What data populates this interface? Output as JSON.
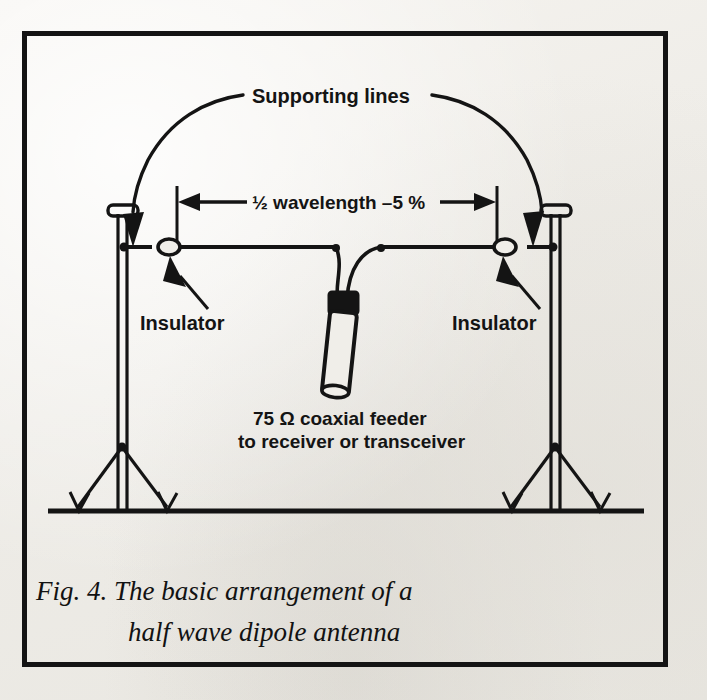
{
  "figure": {
    "domain": "diagram",
    "background_color": "#f0eee9",
    "ink_color": "#141414",
    "frame": {
      "stroke_width": 5,
      "x": 22,
      "y": 31,
      "width": 644,
      "height": 634
    },
    "annotations": {
      "supporting_lines": "Supporting lines",
      "dimension": "½ wavelength –5 %",
      "insulator_left": "Insulator",
      "insulator_right": "Insulator",
      "feeder_line1": "75 Ω coaxial feeder",
      "feeder_line2": "to receiver or transceiver"
    },
    "caption": {
      "line1": "Fig. 4. The basic arrangement of a",
      "line2": "half wave dipole antenna"
    },
    "parts": {
      "mast_left": "left support mast",
      "mast_right": "right support mast",
      "guy_wires": "guy wires",
      "ground_line": "ground line",
      "antenna_wire": "half-wave dipole wire",
      "insulator_bead_left": "insulator bead",
      "insulator_bead_right": "insulator bead",
      "feed_point": "centre feed connector",
      "coax_cable": "coaxial feeder cable",
      "arc_left": "supporting line arc left",
      "arc_right": "supporting line arc right"
    },
    "measurements": {
      "dimension_value": "½ wavelength –5 %",
      "impedance_ohms": "75",
      "impedance_symbol": "Ω"
    }
  }
}
